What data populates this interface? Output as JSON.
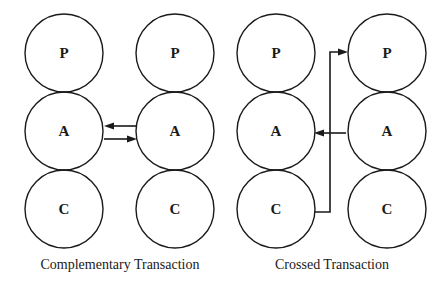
{
  "diagrams": [
    {
      "name": "complementary",
      "caption": "Complementary Transaction",
      "columns": [
        {
          "states": [
            "P",
            "A",
            "C"
          ]
        },
        {
          "states": [
            "P",
            "A",
            "C"
          ]
        }
      ],
      "arrows": [
        {
          "from": "right.A",
          "to": "left.A"
        },
        {
          "from": "left.A",
          "to": "right.A"
        }
      ]
    },
    {
      "name": "crossed",
      "caption": "Crossed Transaction",
      "columns": [
        {
          "states": [
            "P",
            "A",
            "C"
          ]
        },
        {
          "states": [
            "P",
            "A",
            "C"
          ]
        }
      ],
      "arrows": [
        {
          "from": "right.A",
          "to": "left.A"
        },
        {
          "from": "left.C",
          "to": "right.P"
        }
      ]
    }
  ]
}
